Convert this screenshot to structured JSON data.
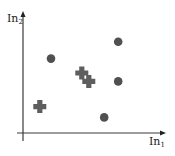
{
  "chart_data": {
    "type": "scatter",
    "title": "",
    "xlabel": "In",
    "xlabel_sub": "1",
    "ylabel": "In",
    "ylabel_sub": "2",
    "grid": false,
    "legend": null,
    "xlim": [
      0,
      10
    ],
    "ylim": [
      0,
      10
    ],
    "series": [
      {
        "name": "class-circle",
        "marker": "circle",
        "color": "#505050",
        "points": [
          {
            "x": 2.0,
            "y": 6.2
          },
          {
            "x": 6.8,
            "y": 7.6
          },
          {
            "x": 6.8,
            "y": 4.3
          },
          {
            "x": 5.8,
            "y": 1.3
          }
        ]
      },
      {
        "name": "class-cross",
        "marker": "cross",
        "color": "#5e5e5e",
        "points": [
          {
            "x": 1.2,
            "y": 2.2
          },
          {
            "x": 4.2,
            "y": 5.0
          },
          {
            "x": 4.7,
            "y": 4.3
          }
        ]
      }
    ]
  },
  "colors": {
    "axis": "#3a3a3a",
    "circle": "#505050",
    "cross": "#5e5e5e"
  }
}
